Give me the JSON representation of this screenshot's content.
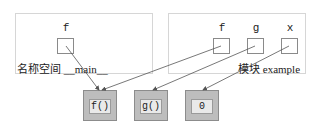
{
  "namespace_main": {
    "caption": "名称空间 __main__",
    "variables": [
      {
        "name": "f"
      }
    ]
  },
  "module_example": {
    "caption": "模块 example",
    "variables": [
      {
        "name": "f"
      },
      {
        "name": "g"
      },
      {
        "name": "x"
      }
    ]
  },
  "objects": [
    {
      "label": "f()"
    },
    {
      "label": "g()"
    },
    {
      "label": "0"
    }
  ],
  "references": [
    {
      "from": "__main__.f",
      "to": "f()"
    },
    {
      "from": "example.f",
      "to": "f()"
    },
    {
      "from": "example.g",
      "to": "g()"
    },
    {
      "from": "example.x",
      "to": "0"
    }
  ],
  "colors": {
    "frame_border": "#d6d6d6",
    "object_fill": "#bdbdbd",
    "object_inner": "#e9e9e9",
    "arrow": "#555555"
  }
}
